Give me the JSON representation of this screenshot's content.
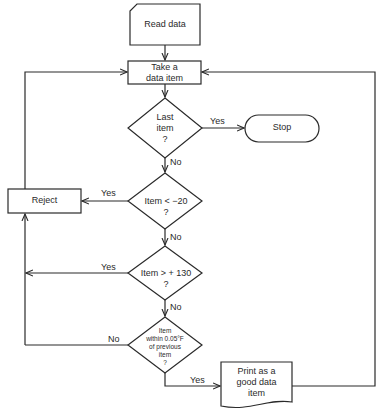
{
  "flowchart": {
    "nodes": {
      "read_data": {
        "shape": "card",
        "label": "Read data"
      },
      "take_item": {
        "shape": "process",
        "label_line1": "Take a",
        "label_line2": "data item"
      },
      "last_item": {
        "shape": "decision",
        "label_line1": "Last",
        "label_line2": "item",
        "label_line3": "?"
      },
      "stop": {
        "shape": "terminator",
        "label": "Stop"
      },
      "lt_minus20": {
        "shape": "decision",
        "label_line1": "Item < −20",
        "label_line2": "?"
      },
      "reject": {
        "shape": "process",
        "label": "Reject"
      },
      "gt_130": {
        "shape": "decision",
        "label_line1": "Item > + 130",
        "label_line2": "?"
      },
      "within": {
        "shape": "decision",
        "label_line1": "Item",
        "label_line2": "within 0.05°F",
        "label_line3": "of previous",
        "label_line4": "item",
        "label_line5": "?"
      },
      "print_good": {
        "shape": "document",
        "label_line1": "Print as a",
        "label_line2": "good data",
        "label_line3": "item"
      }
    },
    "edges": {
      "last_yes": "Yes",
      "last_no": "No",
      "lt_yes": "Yes",
      "lt_no": "No",
      "gt_yes": "Yes",
      "gt_no": "No",
      "within_no": "No",
      "within_yes": "Yes"
    }
  }
}
